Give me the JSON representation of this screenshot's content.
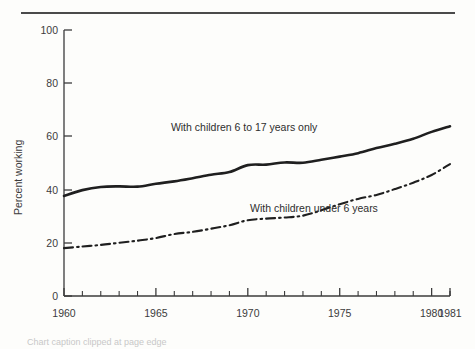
{
  "page": {
    "background_color": "#fdfdfb",
    "ink_color": "#2a2a2a",
    "top_rule": "horizontal-rule"
  },
  "chart_data": {
    "type": "line",
    "title": "",
    "subtitle": "",
    "xlabel": "",
    "ylabel": "Percent working",
    "xlim": [
      1960,
      1981
    ],
    "ylim": [
      0,
      100
    ],
    "grid": false,
    "legend_position": "inline-annotations",
    "y_ticks": [
      0,
      20,
      40,
      60,
      80,
      100
    ],
    "y_tick_labels": [
      "0",
      "20",
      "40",
      "60",
      "80",
      "100"
    ],
    "x_ticks": [
      1960,
      1965,
      1970,
      1975,
      1980,
      1981
    ],
    "x_tick_labels": [
      "1960",
      "1965",
      "1970",
      "1975",
      "1980",
      "1981"
    ],
    "x_minor_tick_interval": 1,
    "x": [
      1960,
      1961,
      1962,
      1963,
      1964,
      1965,
      1966,
      1967,
      1968,
      1969,
      1970,
      1971,
      1972,
      1973,
      1974,
      1975,
      1976,
      1977,
      1978,
      1979,
      1980,
      1981
    ],
    "series": [
      {
        "name": "With children 6 to 17 years only",
        "style": "solid",
        "color": "#1f1f1f",
        "label_text": "With children 6 to 17 years only",
        "values": [
          37.6,
          39.8,
          41.0,
          41.2,
          41.1,
          42.2,
          43.1,
          44.3,
          45.6,
          46.6,
          49.2,
          49.4,
          50.2,
          50.1,
          51.2,
          52.4,
          53.7,
          55.6,
          57.2,
          59.1,
          61.7,
          63.8
        ]
      },
      {
        "name": "With children under 6 years",
        "style": "dash-dot",
        "color": "#1f1f1f",
        "label_text": "With children under 6 years",
        "values": [
          18.0,
          18.6,
          19.2,
          20.0,
          20.8,
          21.8,
          23.3,
          24.1,
          25.3,
          26.6,
          28.5,
          29.1,
          29.5,
          30.2,
          32.2,
          34.5,
          36.5,
          38.0,
          40.2,
          42.6,
          45.5,
          49.6
        ]
      }
    ],
    "annotations": [
      {
        "text": "With children 6 to 17 years only",
        "x": 1969.8,
        "y": 62.0
      },
      {
        "text": "With children under 6 years",
        "x": 1973.6,
        "y": 31.5
      }
    ]
  },
  "footer": {
    "clipped_caption": "Chart caption clipped at page edge"
  }
}
